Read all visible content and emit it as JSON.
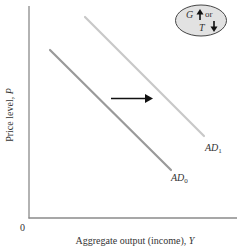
{
  "diagram": {
    "type": "aggregate-demand-shift",
    "axes": {
      "x_label_text": "Aggregate output (income), ",
      "x_label_var": "Y",
      "y_label_text": "Price level, ",
      "y_label_var": "P",
      "origin": "0"
    },
    "curves": [
      {
        "name": "AD",
        "subscript": "0",
        "role": "initial aggregate demand",
        "color": "#9a9a9a"
      },
      {
        "name": "AD",
        "subscript": "1",
        "role": "shifted aggregate demand",
        "color": "#c8c8c8"
      }
    ],
    "shift_arrow": {
      "direction": "right",
      "color": "#111111"
    },
    "policy_box": {
      "g_label": "G",
      "g_direction": "up",
      "or_label": "or",
      "t_label": "T",
      "t_direction": "down",
      "fill": "#e2e2e2"
    },
    "colors": {
      "axis": "#777777",
      "text": "#333333"
    }
  }
}
